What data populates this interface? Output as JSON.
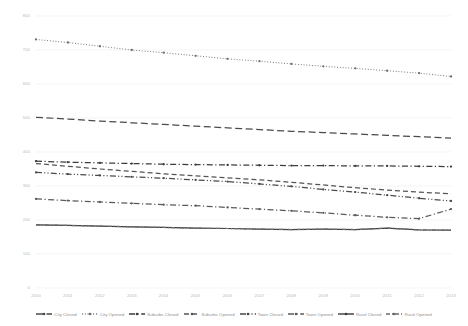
{
  "chart_data": {
    "type": "line",
    "title": "",
    "xlabel": "",
    "ylabel": "",
    "x": [
      2000,
      2001,
      2002,
      2003,
      2004,
      2005,
      2006,
      2007,
      2008,
      2009,
      2010,
      2011,
      2012,
      2013
    ],
    "xlim": [
      2000,
      2013
    ],
    "ylim": [
      0,
      800
    ],
    "yticks": [
      0,
      100,
      200,
      300,
      400,
      500,
      600,
      700,
      800
    ],
    "xticks": [
      "2000",
      "2001",
      "2002",
      "2003",
      "2004",
      "2005",
      "2006",
      "2007",
      "2008",
      "2009",
      "2010",
      "2011",
      "2012",
      "2013"
    ],
    "grid": true,
    "legend_position": "bottom",
    "series": [
      {
        "name": "City Closed",
        "style": "long-dash",
        "color": "#4a4a4a",
        "values": [
          502,
          497,
          491,
          486,
          481,
          476,
          471,
          466,
          461,
          457,
          453,
          449,
          445,
          441
        ]
      },
      {
        "name": "City Opened",
        "style": "dotted",
        "color": "#6e6e6e",
        "values": [
          731,
          722,
          711,
          700,
          692,
          683,
          674,
          667,
          659,
          652,
          646,
          639,
          632,
          622
        ]
      },
      {
        "name": "Suburbs Closed",
        "style": "dash-dot",
        "color": "#3c3c3c",
        "values": [
          373,
          370,
          368,
          366,
          364,
          363,
          362,
          361,
          360,
          360,
          359,
          359,
          358,
          357
        ]
      },
      {
        "name": "Suburbs Opened",
        "style": "dashed",
        "color": "#555555",
        "values": [
          366,
          358,
          350,
          343,
          336,
          330,
          324,
          318,
          311,
          303,
          295,
          288,
          282,
          277
        ]
      },
      {
        "name": "Town Closed",
        "style": "dash-dot-dot",
        "color": "#4a4a4a",
        "values": [
          340,
          335,
          331,
          327,
          323,
          318,
          313,
          306,
          299,
          290,
          282,
          273,
          264,
          256
        ]
      },
      {
        "name": "Town Opened",
        "style": "dash-dot",
        "color": "#5a5a5a",
        "values": [
          262,
          257,
          253,
          249,
          245,
          242,
          237,
          232,
          227,
          221,
          214,
          208,
          204,
          232
        ]
      },
      {
        "name": "Rural Closed",
        "style": "solid",
        "color": "#3a3a3a",
        "values": [
          186,
          184,
          182,
          180,
          178,
          176,
          175,
          173,
          172,
          173,
          172,
          176,
          171,
          170
        ]
      },
      {
        "name": "Rural Opened",
        "style": "dash-dot-short",
        "color": "#6a6a6a",
        "values": [
          186,
          184,
          182,
          180,
          178,
          176,
          175,
          173,
          172,
          173,
          172,
          176,
          171,
          170
        ]
      }
    ]
  },
  "legend": {
    "items": [
      {
        "label": "City Closed"
      },
      {
        "label": "City Opened"
      },
      {
        "label": "Suburbs Closed"
      },
      {
        "label": "Suburbs Opened"
      },
      {
        "label": "Town Closed"
      },
      {
        "label": "Town Opened"
      },
      {
        "label": "Rural Closed"
      },
      {
        "label": "Rural Opened"
      }
    ]
  },
  "colors": {
    "grid": "#ededed",
    "axis_text": "#b9b9b9",
    "legend_text": "#8d8d8d",
    "background": "#ffffff"
  }
}
